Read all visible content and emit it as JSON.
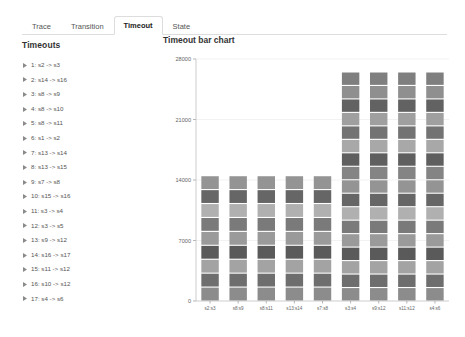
{
  "tabs": [
    {
      "label": "Trace",
      "active": false
    },
    {
      "label": "Transition",
      "active": false
    },
    {
      "label": "Timeout",
      "active": true
    },
    {
      "label": "State",
      "active": false
    }
  ],
  "sidebar": {
    "title": "Timeouts",
    "items": [
      {
        "label": "1: s2 -> s3"
      },
      {
        "label": "2: s14 -> s16"
      },
      {
        "label": "3: s8 -> s9"
      },
      {
        "label": "4: s8 -> s10"
      },
      {
        "label": "5: s8 -> s11"
      },
      {
        "label": "6: s1 -> s2"
      },
      {
        "label": "7: s13 -> s14"
      },
      {
        "label": "8: s13 -> s15"
      },
      {
        "label": "9: s7 -> s8"
      },
      {
        "label": "10: s15 -> s16"
      },
      {
        "label": "11: s3 -> s4"
      },
      {
        "label": "12: s3 -> s5"
      },
      {
        "label": "13: s9 -> s12"
      },
      {
        "label": "14: s16 -> s17"
      },
      {
        "label": "15: s11 -> s12"
      },
      {
        "label": "16: s10 -> s12"
      },
      {
        "label": "17: s4 -> s6"
      }
    ]
  },
  "chart_data": {
    "type": "bar",
    "title": "Timeout bar chart",
    "xlabel": "",
    "ylabel": "",
    "ylim": [
      0,
      28000
    ],
    "yticks": [
      0,
      7000,
      14000,
      21000,
      28000
    ],
    "ytick_labels": [
      "0",
      "7000",
      "14000",
      "21000",
      "28000"
    ],
    "grid": true,
    "legend": false,
    "stacked": true,
    "categories": [
      "s2:s3",
      "s8:s9",
      "s8:s11",
      "s13:s14",
      "s7:s8",
      "s3:s4",
      "s9:s12",
      "s11:s12",
      "s4:s6"
    ],
    "values": [
      14500,
      14500,
      14500,
      14500,
      14500,
      26500,
      26500,
      26500,
      26500
    ],
    "segment_counts": [
      9,
      9,
      9,
      9,
      9,
      17,
      17,
      17,
      17
    ],
    "segment_colors": [
      "#8c8c8c",
      "#6e6e6e",
      "#a3a3a3",
      "#5a5a5a",
      "#9a9a9a",
      "#7a7a7a",
      "#b0b0b0",
      "#666666",
      "#949494",
      "#848484",
      "#5f5f5f",
      "#a8a8a8",
      "#737373",
      "#9f9f9f",
      "#626262",
      "#8f8f8f",
      "#7f7f7f"
    ]
  }
}
